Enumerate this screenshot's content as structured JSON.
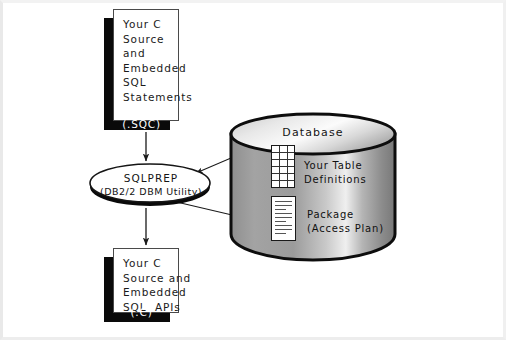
{
  "diagram": {
    "colors": {
      "shadow": "#0a0a0a",
      "box_fill": "#ffffff",
      "box_border": "#4a4a4a",
      "line": "#1a1a1a",
      "cylinder_light": "#f4f4f4",
      "cylinder_mid": "#9a9a9a",
      "cylinder_dark": "#6e6e6e"
    },
    "source_box": {
      "name": "source-box",
      "text": "Your C\nSource\nand\nEmbedded\nSQL\nStatements",
      "extension": "(.SQC)"
    },
    "process": {
      "name": "sqlprep-process",
      "line1": "SQLPREP",
      "line2": "(DB2/2 DBM Utility)"
    },
    "database": {
      "name": "database-cylinder",
      "title": "Database",
      "tables_caption": "Your Table\nDefinitions",
      "package_caption": "Package\n(Access Plan)",
      "tables_icon": "table-grid-icon",
      "package_icon": "document-icon"
    },
    "output_box": {
      "name": "output-box",
      "text": "Your C\nSource and\nEmbedded\nSQL  APIs",
      "extension": "(.C)"
    },
    "connectors": [
      {
        "name": "source-to-sqlprep",
        "from": "source-box",
        "to": "sqlprep-process",
        "arrow": true
      },
      {
        "name": "sqlprep-to-output",
        "from": "sqlprep-process",
        "to": "output-box",
        "arrow": true
      },
      {
        "name": "tables-to-sqlprep",
        "from": "table-grid-icon",
        "to": "sqlprep-process",
        "arrow": true
      },
      {
        "name": "sqlprep-to-package",
        "from": "sqlprep-process",
        "to": "document-icon",
        "arrow": true
      }
    ]
  }
}
